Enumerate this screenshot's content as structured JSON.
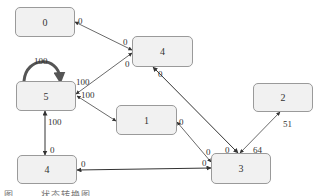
{
  "diagram": {
    "type": "state-transition-graph",
    "nodes": [
      {
        "id": "n0",
        "label": "0",
        "x": 15,
        "y": 7,
        "w": 60,
        "h": 30
      },
      {
        "id": "n4a",
        "label": "4",
        "x": 132,
        "y": 36,
        "w": 61,
        "h": 31
      },
      {
        "id": "n5",
        "label": "5",
        "x": 16,
        "y": 81,
        "w": 60,
        "h": 30
      },
      {
        "id": "n1",
        "label": "1",
        "x": 116,
        "y": 105,
        "w": 61,
        "h": 30
      },
      {
        "id": "n2",
        "label": "2",
        "x": 253,
        "y": 83,
        "w": 60,
        "h": 29
      },
      {
        "id": "n4b",
        "label": "4",
        "x": 17,
        "y": 155,
        "w": 60,
        "h": 29
      },
      {
        "id": "n3",
        "label": "3",
        "x": 211,
        "y": 153,
        "w": 60,
        "h": 31
      }
    ],
    "edges": [
      {
        "from": "n0",
        "to": "n4a",
        "label_from": "0",
        "label_to": "0"
      },
      {
        "from": "n5",
        "to": "n4a",
        "label_from": "100",
        "label_to": "0"
      },
      {
        "from": "n5",
        "to": "n5",
        "label": "100",
        "self_loop": true
      },
      {
        "from": "n5",
        "to": "n1",
        "label_from": "100"
      },
      {
        "from": "n5",
        "to": "n4b",
        "label_from": "100",
        "label_to": "0"
      },
      {
        "from": "n4a",
        "to": "n3",
        "label_from": "0",
        "label_to": "0"
      },
      {
        "from": "n1",
        "to": "n3",
        "label_from": "0",
        "label_to": "0"
      },
      {
        "from": "n4b",
        "to": "n3",
        "label_from": "0",
        "label_to": "0"
      },
      {
        "from": "n2",
        "to": "n3",
        "label_from": "51",
        "label_to": "64"
      }
    ],
    "edge_labels": [
      {
        "text": "0",
        "x": 78,
        "y": 17
      },
      {
        "text": "0",
        "x": 123,
        "y": 38
      },
      {
        "text": "0",
        "x": 125,
        "y": 60
      },
      {
        "text": "100",
        "x": 76,
        "y": 78
      },
      {
        "text": "100",
        "x": 81,
        "y": 91
      },
      {
        "text": "100",
        "x": 34,
        "y": 60
      },
      {
        "text": "0",
        "x": 158,
        "y": 75
      },
      {
        "text": "100",
        "x": 47,
        "y": 121
      },
      {
        "text": "0",
        "x": 50,
        "y": 148
      },
      {
        "text": "0",
        "x": 182,
        "y": 120
      },
      {
        "text": "0",
        "x": 207,
        "y": 148
      },
      {
        "text": "0",
        "x": 203,
        "y": 160
      },
      {
        "text": "0",
        "x": 225,
        "y": 146
      },
      {
        "text": "64",
        "x": 253,
        "y": 146
      },
      {
        "text": "51",
        "x": 281,
        "y": 121
      },
      {
        "text": "0",
        "x": 81,
        "y": 162
      }
    ],
    "caption": "图 . . .  状态转换图"
  },
  "colors": {
    "node_fill": "#f1f1f1",
    "node_border": "#9a9a9a",
    "edge": "#444444",
    "self_loop": "#555555"
  }
}
